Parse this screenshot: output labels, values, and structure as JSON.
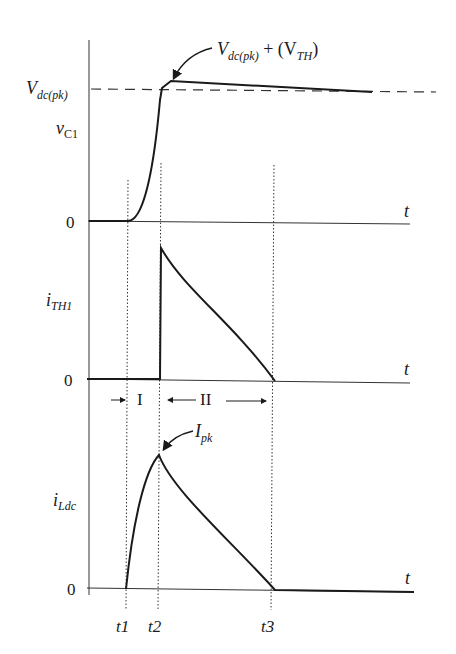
{
  "figure": {
    "type": "timing-waveform-diagram",
    "time_axis_label": "t",
    "time_markers": [
      "t1",
      "t2",
      "t3"
    ],
    "intervals": [
      {
        "label": "I",
        "from": "t1",
        "to": "t2"
      },
      {
        "label": "II",
        "from": "t2",
        "to": "t3"
      }
    ],
    "panels": [
      {
        "signal": "vC1",
        "signal_base": "v",
        "signal_sub": "C1",
        "zero_label": "0",
        "reference_level": {
          "base": "V",
          "sub": "dc(pk)"
        },
        "annotation": {
          "text_base": "V",
          "text_sub": "dc(pk)",
          "text_mid": " + (V",
          "text_sub2": "TH",
          "text_end": ")"
        }
      },
      {
        "signal": "iTH1",
        "signal_base": "i",
        "signal_sub": "TH1",
        "zero_label": "0"
      },
      {
        "signal": "iLdc",
        "signal_base": "i",
        "signal_sub": "Ldc",
        "zero_label": "0",
        "annotation": {
          "text_base": "I",
          "text_sub": "pk"
        }
      }
    ]
  },
  "colors": {
    "line": "#1a1a1a",
    "guide": "#333333",
    "background": "#ffffff"
  }
}
